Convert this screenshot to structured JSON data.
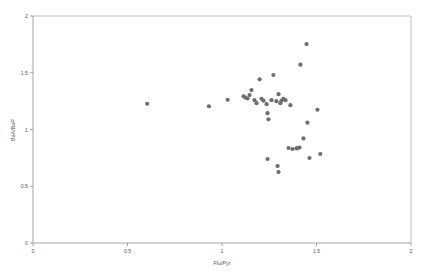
{
  "chart_data": {
    "type": "scatter",
    "title": "",
    "subtitle": "",
    "xlabel": "Flu/Pyr",
    "ylabel": "BaA/BaP",
    "xlim": [
      0,
      2
    ],
    "ylim": [
      0,
      2
    ],
    "xticks": [
      0,
      0.5,
      1,
      1.5,
      2
    ],
    "xticklabels": [
      "0",
      "0.5",
      "1",
      "1.5",
      "2"
    ],
    "yticks": [
      0,
      0.5,
      1,
      1.5,
      2
    ],
    "yticklabels": [
      "0",
      "0.5",
      "1",
      "1.5",
      "2"
    ],
    "grid": false,
    "legend": null,
    "marker": {
      "shape": "circle",
      "color": "#6d6d72",
      "size": 2.1
    },
    "series": [
      {
        "name": "samples",
        "points": [
          [
            0.604,
            1.227
          ],
          [
            0.931,
            1.205
          ],
          [
            1.03,
            1.262
          ],
          [
            1.114,
            1.292
          ],
          [
            1.124,
            1.281
          ],
          [
            1.135,
            1.273
          ],
          [
            1.146,
            1.303
          ],
          [
            1.156,
            1.347
          ],
          [
            1.172,
            1.258
          ],
          [
            1.183,
            1.232
          ],
          [
            1.199,
            1.442
          ],
          [
            1.209,
            1.271
          ],
          [
            1.22,
            1.254
          ],
          [
            1.236,
            1.223
          ],
          [
            1.241,
            1.144
          ],
          [
            1.246,
            1.09
          ],
          [
            1.262,
            1.258
          ],
          [
            1.272,
            1.48
          ],
          [
            1.288,
            1.25
          ],
          [
            1.299,
            1.311
          ],
          [
            1.309,
            1.232
          ],
          [
            1.315,
            1.254
          ],
          [
            1.325,
            1.271
          ],
          [
            1.336,
            1.258
          ],
          [
            1.241,
            0.74
          ],
          [
            1.294,
            0.678
          ],
          [
            1.299,
            0.625
          ],
          [
            1.352,
            0.837
          ],
          [
            1.362,
            1.214
          ],
          [
            1.373,
            0.828
          ],
          [
            1.394,
            0.833
          ],
          [
            1.399,
            0.837
          ],
          [
            1.41,
            0.841
          ],
          [
            1.415,
            1.571
          ],
          [
            1.431,
            0.921
          ],
          [
            1.447,
            1.753
          ],
          [
            1.452,
            1.06
          ],
          [
            1.463,
            0.749
          ],
          [
            1.505,
            1.174
          ],
          [
            1.52,
            0.784
          ]
        ]
      }
    ],
    "n_points": 40
  },
  "axes": {
    "x_axis_name": "x-axis",
    "y_axis_name": "y-axis"
  }
}
